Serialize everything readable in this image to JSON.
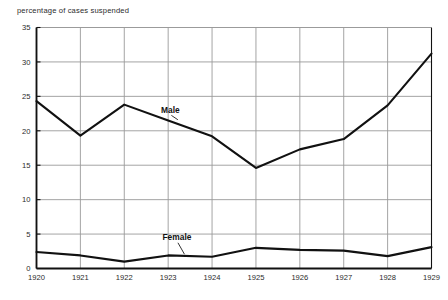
{
  "chart_data": {
    "type": "line",
    "title": "percentage of cases suspended",
    "xlabel": "",
    "ylabel": "",
    "xlim": [
      1920,
      1929
    ],
    "ylim": [
      0,
      35
    ],
    "grid": true,
    "legend_position": "inline-annotation",
    "x": [
      1920,
      1921,
      1922,
      1923,
      1924,
      1925,
      1926,
      1927,
      1928,
      1929
    ],
    "categories": [
      "1920",
      "1921",
      "1922",
      "1923",
      "1924",
      "1925",
      "1926",
      "1927",
      "1928",
      "1929"
    ],
    "yticks": [
      0,
      5,
      10,
      15,
      20,
      25,
      30,
      35
    ],
    "ytick_labels": [
      "0",
      "5",
      "10",
      "15",
      "20",
      "25",
      "30",
      "35"
    ],
    "xtick_labels": [
      "1920",
      "1921",
      "1922",
      "1923",
      "1924",
      "1925",
      "1926",
      "1927",
      "1928",
      "1929"
    ],
    "series": [
      {
        "name": "Male",
        "label": "Male",
        "color": "#111111",
        "values": [
          24.3,
          19.3,
          23.8,
          21.5,
          19.2,
          14.6,
          17.3,
          18.8,
          23.7,
          31.2
        ],
        "label_x": 1923.05,
        "label_y": 22.6
      },
      {
        "name": "Female",
        "label": "Female",
        "color": "#111111",
        "values": [
          2.4,
          1.9,
          1.0,
          1.9,
          1.7,
          3.0,
          2.7,
          2.6,
          1.8,
          3.1
        ],
        "label_x": 1923.2,
        "label_y": 4.1
      }
    ],
    "colors": {
      "line": "#111111",
      "grid": "#9a9a9a",
      "axis": "#111111",
      "background": "#ffffff",
      "text": "#2b2b2b"
    }
  }
}
